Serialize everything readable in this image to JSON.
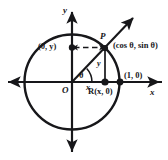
{
  "figure": {
    "colors": {
      "stroke": "#17171a",
      "background": "#ffffff",
      "point_fill": "#17171a",
      "dashed": "#17171a"
    },
    "axes": {
      "x_label": "x",
      "y_label": "y",
      "origin_label": "O"
    },
    "circle": {
      "center_label": "O",
      "radius_note": "1"
    },
    "points": [
      {
        "id": "P",
        "label": "P",
        "coord_label": "(cos θ, sin θ)",
        "x_px": 105,
        "y_px": 48
      },
      {
        "id": "R",
        "label": "R(x, 0)",
        "coord_label": "R(x, 0)",
        "x_px": 105,
        "y_px": 82
      },
      {
        "id": "unit",
        "label": "(1, 0)",
        "coord_label": "(1, 0)",
        "x_px": 120,
        "y_px": 82
      },
      {
        "id": "yint",
        "label": "(0, y)",
        "coord_label": "(0, y)",
        "x_px": 72,
        "y_px": 48
      }
    ],
    "segments": [
      {
        "id": "adjacent",
        "label": "x"
      },
      {
        "id": "opposite",
        "label": "y"
      }
    ],
    "angle": {
      "label": "θ",
      "vertex": "O"
    }
  },
  "labels": {
    "y_axis": "y",
    "x_axis": "x",
    "origin": "O",
    "point_p": "P",
    "p_coords": "(cos θ, sin θ)",
    "r_point": "R(x, 0)",
    "unit_point": "(1, 0)",
    "y_intercept_point": "(0, y)",
    "theta": "θ",
    "seg_x": "x",
    "seg_y": "y"
  }
}
